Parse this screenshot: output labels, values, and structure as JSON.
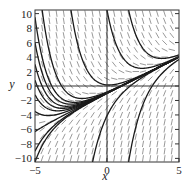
{
  "figure": {
    "type": "slope_field",
    "equation": "dy/dx = x - y",
    "xlabel": "x",
    "ylabel": "y",
    "x_ticks": [
      "-5",
      "0",
      "5"
    ],
    "y_ticks": [
      "10",
      "8",
      "6",
      "4",
      "2",
      "0",
      "-2",
      "-4",
      "-6",
      "-8",
      "-10"
    ],
    "xlim": [
      -5,
      5
    ],
    "ylim": [
      -10.5,
      10.5
    ],
    "colors": {
      "curve": "#1a1a1a",
      "slope": "#555555",
      "frame": "#333333"
    }
  },
  "chart_data": {
    "type": "slope_field",
    "title": "",
    "xlabel": "x",
    "ylabel": "y",
    "xlim": [
      -5,
      5
    ],
    "ylim": [
      -10.5,
      10.5
    ],
    "x_tick_labels": [
      "-5",
      "0",
      "5"
    ],
    "y_tick_labels": [
      "-10",
      "-8",
      "-6",
      "-4",
      "-2",
      "0",
      "2",
      "4",
      "6",
      "8",
      "10"
    ],
    "grid": false,
    "axes_lines": {
      "x0": true,
      "y0": true
    },
    "slope_function": "x - y",
    "solution_curves_initial_y_at_x_minus_5": [
      -10.5,
      -9,
      -6.3,
      -3.5,
      -1.2,
      0.8,
      3,
      6,
      9.5
    ],
    "solution_curves_extra_initial_points": [
      [
        -4.5,
        10.5
      ],
      [
        -2.5,
        10.5
      ],
      [
        0,
        10.5
      ],
      [
        1.5,
        10.5
      ],
      [
        -1,
        -10.5
      ],
      [
        1.5,
        -10.5
      ]
    ],
    "asymptote": "y = x - 1"
  }
}
